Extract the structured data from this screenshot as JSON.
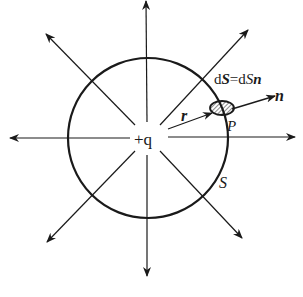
{
  "diagram": {
    "type": "gauss-law-point-charge",
    "charge_label": "+q",
    "surface_label": "S",
    "point_label": "P",
    "radius_vector_label": "r",
    "normal_label": "n",
    "area_element_label": {
      "d1": "d",
      "S1": "S",
      "eq": "=d",
      "S2": "S",
      "n": "n"
    },
    "center": [
      148,
      138
    ],
    "radius": 80,
    "field_line_count": 8,
    "colors": {
      "stroke": "#1a1a1a",
      "background": "#ffffff"
    }
  }
}
